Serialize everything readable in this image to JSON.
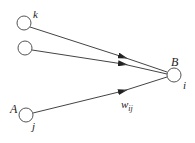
{
  "diagram": {
    "type": "neural-network-connection",
    "nodes": [
      {
        "id": "k",
        "label": "k",
        "cx": 24,
        "cy": 23,
        "r": 7
      },
      {
        "id": "m",
        "label": "",
        "cx": 25,
        "cy": 48,
        "r": 7
      },
      {
        "id": "A",
        "label_outer": "A",
        "label_inner": "j",
        "cx": 26,
        "cy": 115,
        "r": 7
      },
      {
        "id": "B",
        "label_outer": "B",
        "label_inner": "i",
        "cx": 174,
        "cy": 75,
        "r": 7
      }
    ],
    "edges": [
      {
        "from": "k",
        "to": "B"
      },
      {
        "from": "m",
        "to": "B"
      },
      {
        "from": "A",
        "to": "B",
        "label": "w",
        "label_sub": "ij"
      }
    ],
    "labels": {
      "k": "k",
      "A": "A",
      "j": "j",
      "B": "B",
      "i": "i",
      "weight": "w",
      "weight_sub": "ij"
    }
  }
}
